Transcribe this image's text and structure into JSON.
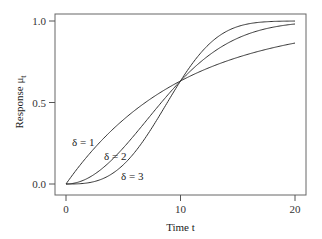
{
  "chart_data": {
    "type": "line",
    "title": "",
    "xlabel": "Time t",
    "ylabel": "Response μ_t",
    "xlim": [
      0,
      20
    ],
    "ylim": [
      0,
      1
    ],
    "xticks": [
      "0",
      "10",
      "20"
    ],
    "yticks": [
      "0.0",
      "0.5",
      "1.0"
    ],
    "grid": false,
    "legend": "none (inline annotations)",
    "model": "μ_t = 1 - exp(-(t/10)^δ)",
    "x": [
      0,
      2,
      4,
      6,
      8,
      10,
      12,
      14,
      16,
      18,
      20
    ],
    "series": [
      {
        "name": "δ = 1",
        "values": [
          0.0,
          0.181,
          0.33,
          0.451,
          0.551,
          0.632,
          0.699,
          0.753,
          0.798,
          0.835,
          0.865
        ]
      },
      {
        "name": "δ = 2",
        "values": [
          0.0,
          0.039,
          0.148,
          0.302,
          0.473,
          0.632,
          0.763,
          0.859,
          0.923,
          0.961,
          0.982
        ]
      },
      {
        "name": "δ = 3",
        "values": [
          0.0,
          0.008,
          0.062,
          0.194,
          0.401,
          0.632,
          0.822,
          0.936,
          0.983,
          0.997,
          1.0
        ]
      }
    ],
    "annotations": [
      {
        "text": "δ = 1",
        "x": 1.5,
        "y": 0.3
      },
      {
        "text": "δ = 2",
        "x": 4.2,
        "y": 0.2
      },
      {
        "text": "δ = 3",
        "x": 5.8,
        "y": 0.1
      }
    ]
  },
  "labels": {
    "xlabel": "Time t",
    "ylabel": "Response μ",
    "ylabel_sub": "t",
    "x0": "0",
    "x10": "10",
    "x20": "20",
    "y0": "0.0",
    "y05": "0.5",
    "y1": "1.0",
    "d1": "δ = 1",
    "d2": "δ = 2",
    "d3": "δ = 3"
  },
  "colors": {
    "line": "#333333",
    "frame": "#555555"
  }
}
